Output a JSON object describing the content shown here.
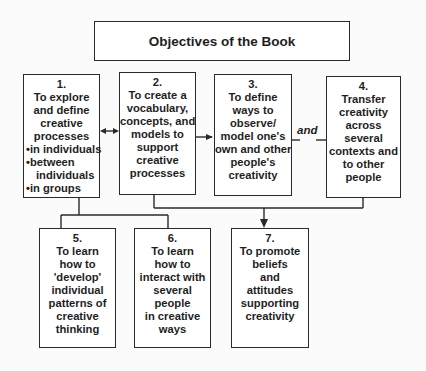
{
  "title": "Objectives of the Book",
  "connector_label": "and",
  "boxes": [
    {
      "num": "1.",
      "lines": [
        "To explore",
        "and define",
        "creative",
        "processes"
      ],
      "bullets": [
        "•in individuals",
        "•between",
        "individuals",
        "•in groups"
      ]
    },
    {
      "num": "2.",
      "lines": [
        "To create a",
        "vocabulary,",
        "concepts, and",
        "models to",
        "support",
        "creative",
        "processes"
      ]
    },
    {
      "num": "3.",
      "lines": [
        "To define",
        "ways to",
        "observe/",
        "model one's",
        "own and other",
        "people's",
        "creativity"
      ]
    },
    {
      "num": "4.",
      "lines": [
        "Transfer",
        "creativity",
        "across",
        "several",
        "contexts and",
        "to other",
        "people"
      ]
    },
    {
      "num": "5.",
      "lines": [
        "To learn",
        "how to",
        "'develop'",
        "individual",
        "patterns of",
        "creative",
        "thinking"
      ]
    },
    {
      "num": "6.",
      "lines": [
        "To learn",
        "how to",
        "interact with",
        "several",
        "people",
        "in creative",
        "ways"
      ]
    },
    {
      "num": "7.",
      "lines": [
        "To promote",
        "beliefs",
        "and",
        "attitudes",
        "supporting",
        "creativity"
      ]
    }
  ]
}
